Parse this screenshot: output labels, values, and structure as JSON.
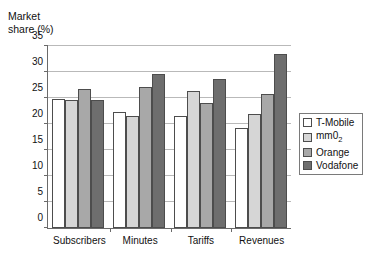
{
  "chart_data": {
    "type": "bar",
    "title": "",
    "subtitle": "",
    "xlabel": "",
    "ylabel": "Market\nshare (%)",
    "ylim": [
      0,
      35
    ],
    "ytick_step": 5,
    "yticks": [
      "0",
      "5",
      "10",
      "15",
      "20",
      "25",
      "30",
      "35"
    ],
    "grid": "horizontal",
    "legend_position": "right",
    "categories": [
      "Subscribers",
      "Minutes",
      "Tariffs",
      "Revenues"
    ],
    "series": [
      {
        "name": "T-Mobile",
        "color": "#ffffff",
        "values": [
          24.8,
          22.4,
          21.5,
          19.2
        ]
      },
      {
        "name": "mm0_2",
        "color": "#d6d6d6",
        "values": [
          24.7,
          21.6,
          26.4,
          22.0
        ]
      },
      {
        "name": "Orange",
        "color": "#a8a8a8",
        "values": [
          26.7,
          27.2,
          24.0,
          25.8
        ]
      },
      {
        "name": "Vodafone",
        "color": "#6e6e6e",
        "values": [
          24.6,
          29.7,
          28.6,
          33.4
        ]
      }
    ],
    "legend_labels": [
      "T-Mobile",
      "mm0₂",
      "Orange",
      "Vodafone"
    ]
  }
}
